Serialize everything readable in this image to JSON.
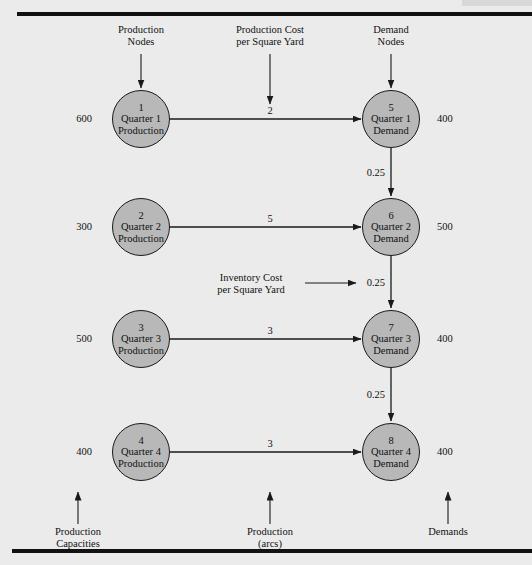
{
  "figure": {
    "type": "network-flow-diagram",
    "background_color": "#ebebeb",
    "node_fill_color": "#b8b8b8",
    "node_border_color": "#1a1a1a",
    "line_color": "#1a1a1a"
  },
  "annotations": {
    "top": [
      {
        "name": "production-nodes",
        "line1": "Production",
        "line2": "Nodes"
      },
      {
        "name": "production-cost",
        "line1": "Production Cost",
        "line2": "per Square Yard"
      },
      {
        "name": "demand-nodes",
        "line1": "Demand",
        "line2": "Nodes"
      }
    ],
    "middle": {
      "name": "inventory-cost",
      "line1": "Inventory Cost",
      "line2": "per Square Yard"
    },
    "bottom": [
      {
        "name": "production-capacities",
        "line1": "Production",
        "line2": "Capacities"
      },
      {
        "name": "production-arcs",
        "line1": "Production",
        "line2": "(arcs)"
      },
      {
        "name": "demands",
        "line1": "Demands",
        "line2": ""
      }
    ]
  },
  "nodes": {
    "production": [
      {
        "id": "1",
        "line1": "Quarter 1",
        "line2": "Production",
        "capacity": "600"
      },
      {
        "id": "2",
        "line1": "Quarter 2",
        "line2": "Production",
        "capacity": "300"
      },
      {
        "id": "3",
        "line1": "Quarter 3",
        "line2": "Production",
        "capacity": "500"
      },
      {
        "id": "4",
        "line1": "Quarter 4",
        "line2": "Production",
        "capacity": "400"
      }
    ],
    "demand": [
      {
        "id": "5",
        "line1": "Quarter 1",
        "line2": "Demand",
        "demand": "400"
      },
      {
        "id": "6",
        "line1": "Quarter 2",
        "line2": "Demand",
        "demand": "500"
      },
      {
        "id": "7",
        "line1": "Quarter 3",
        "line2": "Demand",
        "demand": "400"
      },
      {
        "id": "8",
        "line1": "Quarter 4",
        "line2": "Demand",
        "demand": "400"
      }
    ]
  },
  "arcs": {
    "production": [
      {
        "from": "1",
        "to": "5",
        "cost": "2"
      },
      {
        "from": "2",
        "to": "6",
        "cost": "5"
      },
      {
        "from": "3",
        "to": "7",
        "cost": "3"
      },
      {
        "from": "4",
        "to": "8",
        "cost": "3"
      }
    ],
    "inventory": [
      {
        "from": "5",
        "to": "6",
        "cost": "0.25"
      },
      {
        "from": "6",
        "to": "7",
        "cost": "0.25"
      },
      {
        "from": "7",
        "to": "8",
        "cost": "0.25"
      }
    ]
  }
}
